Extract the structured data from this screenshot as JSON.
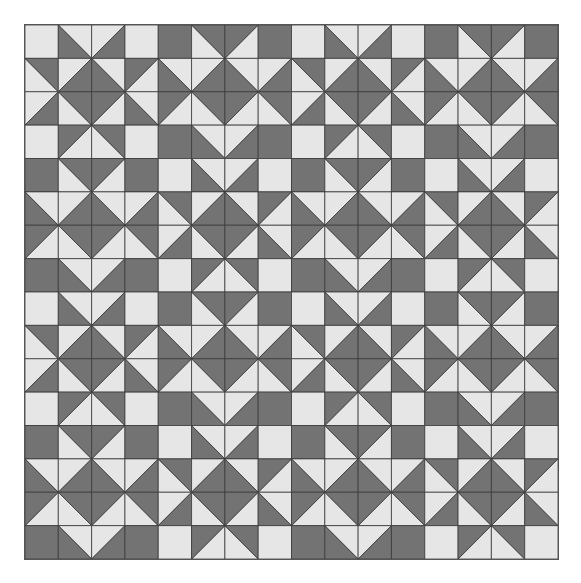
{
  "quilt": {
    "grid_size": 16,
    "block_size": 4,
    "colors": {
      "dark": "#737373",
      "light": "#e6e6e6",
      "line": "#3a3a3a"
    },
    "blocks": {
      "A": [
        [
          "L",
          "BL",
          "BR",
          "L"
        ],
        [
          "TR",
          "BR",
          "BL",
          "TL"
        ],
        [
          "BR",
          "TR",
          "TL",
          "BL"
        ],
        [
          "L",
          "TL",
          "TR",
          "L"
        ]
      ],
      "B": [
        [
          "D",
          "TR",
          "TL",
          "D"
        ],
        [
          "BL",
          "BR",
          "BL",
          "BR"
        ],
        [
          "TL",
          "TR",
          "TL",
          "TR"
        ],
        [
          "D",
          "BL",
          "BR",
          "D"
        ]
      ]
    },
    "layout": [
      [
        "A",
        "B",
        "A",
        "B"
      ],
      [
        "B",
        "A",
        "B",
        "A"
      ],
      [
        "A",
        "B",
        "A",
        "B"
      ],
      [
        "B",
        "A",
        "B",
        "A"
      ]
    ]
  }
}
